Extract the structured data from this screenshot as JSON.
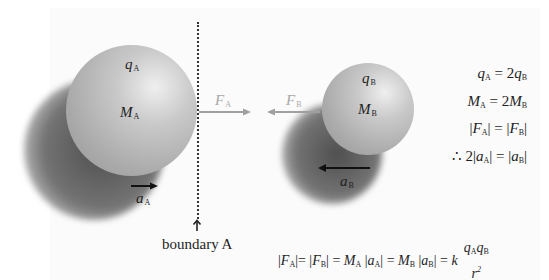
{
  "diagram": {
    "sphere_a": {
      "charge_label": "q",
      "charge_sub": "A",
      "mass_label": "M",
      "mass_sub": "A"
    },
    "sphere_b": {
      "charge_label": "q",
      "charge_sub": "B",
      "mass_label": "M",
      "mass_sub": "B"
    },
    "force_a": {
      "label": "F",
      "sub": "A",
      "color": "#a0a0a0"
    },
    "force_b": {
      "label": "F",
      "sub": "B",
      "color": "#a0a0a0"
    },
    "accel_a": {
      "label": "a",
      "sub": "A",
      "color": "#111111"
    },
    "accel_b": {
      "label": "a",
      "sub": "B",
      "color": "#111111"
    },
    "boundary_label": "boundary A",
    "equations": [
      {
        "id": "charge",
        "text": "q_A = 2q_B"
      },
      {
        "id": "mass",
        "text": "M_A = 2M_B"
      },
      {
        "id": "force",
        "text": "|F_A| = |F_B|"
      },
      {
        "id": "accel",
        "text": "∴ 2|a_A| = |a_B|"
      }
    ],
    "bottom_equation": {
      "text": "|F_A| = |F_B| = M_A |a_A| = M_B |a_B| = k q_A q_B / r^2",
      "numerator": "q_A q_B",
      "denominator": "r^2",
      "constant": "k"
    }
  }
}
